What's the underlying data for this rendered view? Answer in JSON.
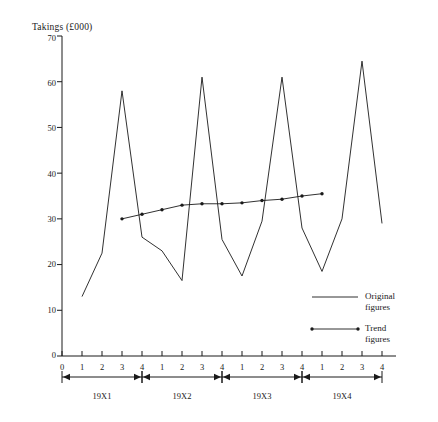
{
  "chart_data": {
    "type": "line",
    "title": "",
    "ylabel": "Takings (£000)",
    "xlabel": "",
    "ylim": [
      0,
      70
    ],
    "ytick_labels": [
      "0",
      "10",
      "20",
      "30",
      "40",
      "50",
      "60",
      "70"
    ],
    "ytick_values": [
      0,
      10,
      20,
      30,
      40,
      50,
      60,
      70
    ],
    "grid": false,
    "legend_position": "inside-lower-right",
    "x_axis_origin_label": "0",
    "xtick_labels": [
      "0",
      "1",
      "2",
      "3",
      "4",
      "1",
      "2",
      "3",
      "4",
      "1",
      "2",
      "3",
      "4",
      "1",
      "2",
      "3",
      "4"
    ],
    "period_brackets": [
      {
        "label": "19X1",
        "start_quarter": 1,
        "end_quarter": 4
      },
      {
        "label": "19X2",
        "start_quarter": 5,
        "end_quarter": 8
      },
      {
        "label": "19X3",
        "start_quarter": 9,
        "end_quarter": 12
      },
      {
        "label": "19X4",
        "start_quarter": 13,
        "end_quarter": 16
      }
    ],
    "categories": [
      "19X1 Q1",
      "19X1 Q2",
      "19X1 Q3",
      "19X1 Q4",
      "19X2 Q1",
      "19X2 Q2",
      "19X2 Q3",
      "19X2 Q4",
      "19X3 Q1",
      "19X3 Q2",
      "19X3 Q3",
      "19X3 Q4",
      "19X4 Q1",
      "19X4 Q2",
      "19X4 Q3",
      "19X4 Q4"
    ],
    "series": [
      {
        "name": "Original figures",
        "marker": "none",
        "x": [
          1,
          2,
          3,
          4,
          5,
          6,
          7,
          8,
          9,
          10,
          11,
          12,
          13,
          14,
          15,
          16
        ],
        "values": [
          13,
          22.5,
          58,
          26,
          23,
          16.5,
          61,
          25.5,
          17.5,
          29.5,
          61,
          28,
          18.5,
          30,
          64.5,
          29
        ]
      },
      {
        "name": "Trend figures",
        "marker": "dot",
        "x": [
          3,
          4,
          5,
          6,
          7,
          8,
          9,
          10,
          11,
          12,
          13
        ],
        "values": [
          30,
          31,
          32,
          33,
          33.3,
          33.3,
          33.5,
          34,
          34.3,
          35,
          35.5
        ]
      }
    ]
  },
  "legend": {
    "entries": [
      {
        "line1": "Original",
        "line2": "figures",
        "marker": "none"
      },
      {
        "line1": "Trend",
        "line2": "figures",
        "marker": "dot"
      }
    ]
  },
  "axis": {
    "y_title": "Takings (£000)"
  }
}
